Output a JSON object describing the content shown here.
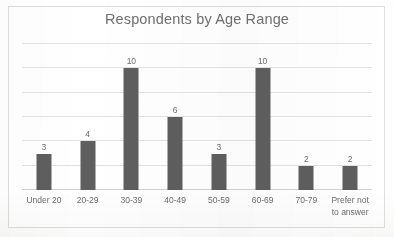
{
  "chart_data": {
    "type": "bar",
    "title": "Respondents by Age Range",
    "xlabel": "",
    "ylabel": "",
    "categories": [
      "Under 20",
      "20-29",
      "30-39",
      "40-49",
      "50-59",
      "60-69",
      "70-79",
      "Prefer not to answer"
    ],
    "category_lines": [
      [
        "Under 20"
      ],
      [
        "20-29"
      ],
      [
        "30-39"
      ],
      [
        "40-49"
      ],
      [
        "50-59"
      ],
      [
        "60-69"
      ],
      [
        "70-79"
      ],
      [
        "Prefer not",
        "to answer"
      ]
    ],
    "values": [
      3,
      4,
      10,
      6,
      3,
      10,
      2,
      2
    ],
    "data_labels": [
      "3",
      "4",
      "10",
      "6",
      "3",
      "10",
      "2",
      "2"
    ],
    "ylim": [
      0,
      12
    ],
    "y_tick_step": 2,
    "y_tick_labels_visible": false,
    "gridlines": true,
    "gridline_values": [
      0,
      2,
      4,
      6,
      8,
      10,
      12
    ],
    "legend": false,
    "legend_position": "none",
    "series_name": "Respondents",
    "bar_color": "#5e5e5e",
    "gridline_color": "#e2e2de",
    "title_color": "#6f6f6f",
    "label_color": "#6b6b6b",
    "plot_background": "#ffffff",
    "frame_border_color": "#dededa"
  }
}
